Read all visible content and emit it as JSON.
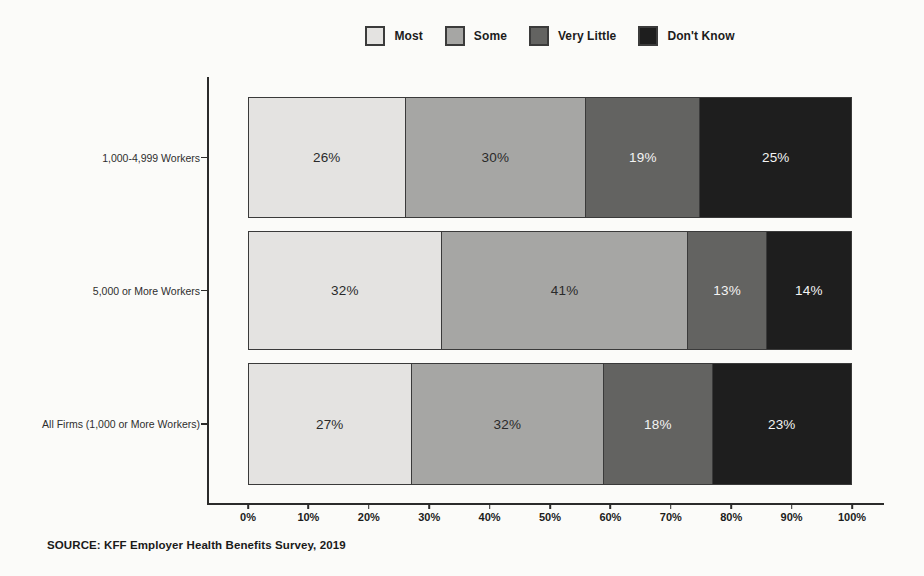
{
  "chart_data": {
    "type": "bar",
    "orientation": "horizontal",
    "stacked": true,
    "title": "",
    "xlabel": "",
    "ylabel": "",
    "xlim": [
      0,
      100
    ],
    "legend_position": "top",
    "value_suffix": "%",
    "categories": [
      "1,000-4,999 Workers",
      "5,000 or More Workers",
      "All Firms (1,000 or More Workers)"
    ],
    "series": [
      {
        "name": "Most",
        "color": "#e4e3e1",
        "text_color": "#2a2a2a",
        "values": [
          26,
          32,
          27
        ]
      },
      {
        "name": "Some",
        "color": "#a6a6a4",
        "text_color": "#2a2a2a",
        "values": [
          30,
          41,
          32
        ]
      },
      {
        "name": "Very Little",
        "color": "#636361",
        "text_color": "#f4f4f4",
        "values": [
          19,
          13,
          18
        ]
      },
      {
        "name": "Don't Know",
        "color": "#1e1e1e",
        "text_color": "#f4f4f4",
        "values": [
          25,
          14,
          23
        ]
      }
    ],
    "x_ticks": [
      "0%",
      "10%",
      "20%",
      "30%",
      "40%",
      "50%",
      "60%",
      "70%",
      "80%",
      "90%",
      "100%"
    ]
  },
  "source": "SOURCE: KFF Employer Health Benefits Survey, 2019",
  "colors": {
    "axis": "#2b2b2b",
    "segment_border": "#3a3a3a",
    "background": "#fbfbf9"
  }
}
